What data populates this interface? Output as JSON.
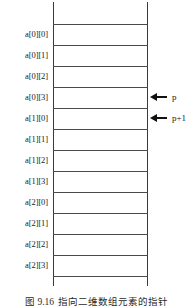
{
  "figure": {
    "type": "memory-layout-diagram",
    "caption": {
      "number": "图 9.16",
      "text": "指向二维数组元素的指针"
    },
    "column": {
      "top_empty_cell": true,
      "bottom_empty_cell": true,
      "cell_count": 12
    },
    "cells": [
      {
        "index": 0,
        "label": "a[0][0]"
      },
      {
        "index": 1,
        "label": "a[0][1]"
      },
      {
        "index": 2,
        "label": "a[0][2]"
      },
      {
        "index": 3,
        "label": "a[0][3]"
      },
      {
        "index": 4,
        "label": "a[1][0]"
      },
      {
        "index": 5,
        "label": "a[1][1]"
      },
      {
        "index": 6,
        "label": "a[1][2]"
      },
      {
        "index": 7,
        "label": "a[1][3]"
      },
      {
        "index": 8,
        "label": "a[2][0]"
      },
      {
        "index": 9,
        "label": "a[2][1]"
      },
      {
        "index": 10,
        "label": "a[2][2]"
      },
      {
        "index": 11,
        "label": "a[2][3]"
      }
    ],
    "pointers": [
      {
        "label": "p",
        "target_cell": "a[0][3]",
        "icon": "arrow-left-icon"
      },
      {
        "label": "p+1",
        "target_cell": "a[1][0]",
        "icon": "arrow-left-icon"
      }
    ],
    "colors": {
      "rule": "#4a4a4a",
      "rail": "#3a3a3a",
      "text": "#1a1a1a",
      "background": "#ffffff"
    }
  }
}
